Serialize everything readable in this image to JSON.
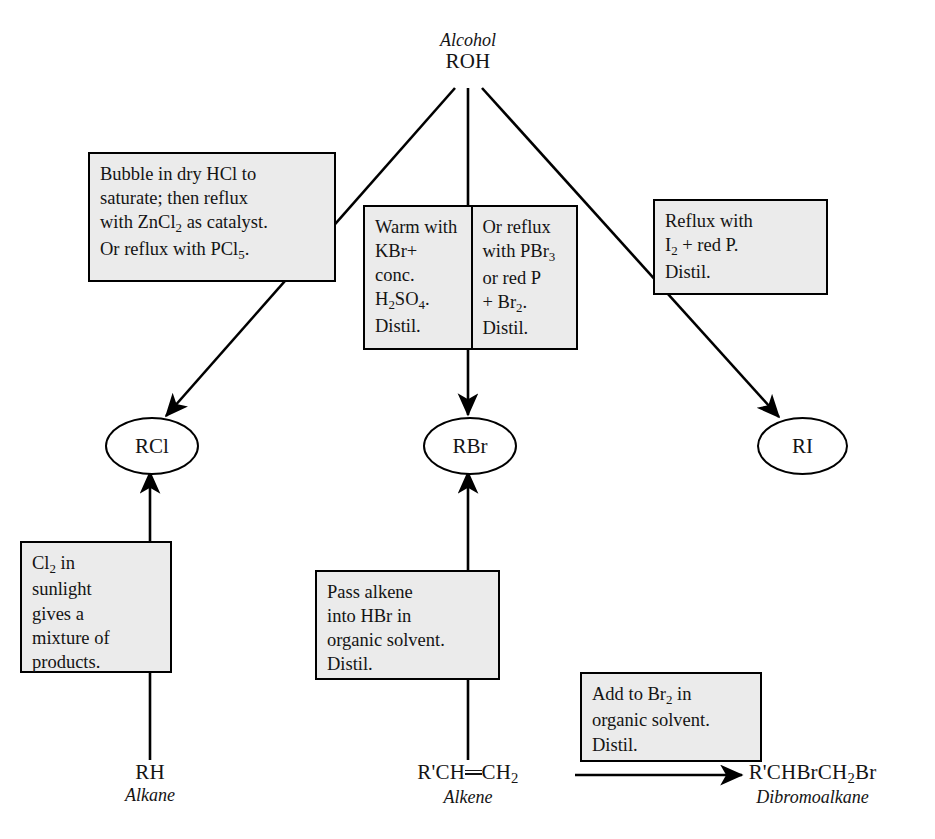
{
  "diagram": {
    "title_node": {
      "italic": "Alcohol",
      "formula": "ROH"
    },
    "products": [
      {
        "id": "rcl",
        "label": "RCl"
      },
      {
        "id": "rbr",
        "label": "RBr"
      },
      {
        "id": "ri",
        "label": "RI"
      }
    ],
    "reagent_boxes": {
      "to_rcl": {
        "lines": [
          "Bubble in dry HCl to",
          "saturate; then reflux",
          "with ZnCl|2| as catalyst.",
          "Or reflux with PCl|5|."
        ]
      },
      "to_rbr_left": {
        "lines": [
          "Warm with",
          "KBr+",
          "conc.",
          "H|2|SO|4|.",
          "Distil."
        ]
      },
      "to_rbr_right": {
        "lines": [
          "Or reflux",
          "with PBr|3|",
          "or red P",
          "+ Br|2|.",
          "Distil."
        ]
      },
      "to_ri": {
        "lines": [
          "Reflux with",
          "I|2| + red P.",
          "Distil."
        ]
      },
      "alkane_to_rcl": {
        "lines": [
          "Cl|2| in",
          "sunlight",
          "gives a",
          "mixture of",
          "products."
        ]
      },
      "alkene_to_rbr": {
        "lines": [
          "Pass alkene",
          "into HBr in",
          "organic solvent.",
          "Distil."
        ]
      },
      "alkene_to_dibromo": {
        "lines": [
          "Add to Br|2| in",
          "organic solvent.",
          "Distil."
        ]
      }
    },
    "bottom_labels": [
      {
        "id": "alkane",
        "formula": "RH",
        "name": "Alkane"
      },
      {
        "id": "alkene",
        "formula": "R'CH=CH|2|",
        "name": "Alkene"
      },
      {
        "id": "dibromoalkane",
        "formula": "R'CHBrCH|2|Br",
        "name": "Dibromoalkane"
      }
    ],
    "colors": {
      "box_fill": "#ebebeb",
      "stroke": "#000000",
      "text": "#141414",
      "page_background": "#ffffff"
    }
  },
  "chart_data": {
    "type": "diagram",
    "nodes": [
      {
        "id": "roh",
        "label": "ROH",
        "sublabel": "Alcohol",
        "shape": "text",
        "x": 468,
        "y": 60
      },
      {
        "id": "rcl",
        "label": "RCl",
        "sublabel": "",
        "shape": "ellipse",
        "x": 150,
        "y": 440
      },
      {
        "id": "rbr",
        "label": "RBr",
        "sublabel": "",
        "shape": "ellipse",
        "x": 468,
        "y": 440
      },
      {
        "id": "ri",
        "label": "RI",
        "sublabel": "",
        "shape": "ellipse",
        "x": 800,
        "y": 440
      },
      {
        "id": "rh",
        "label": "RH",
        "sublabel": "Alkane",
        "shape": "text",
        "x": 150,
        "y": 790
      },
      {
        "id": "alkene",
        "label": "R'CH=CH2",
        "sublabel": "Alkene",
        "shape": "text",
        "x": 468,
        "y": 790
      },
      {
        "id": "dibr",
        "label": "R'CHBrCH2Br",
        "sublabel": "Dibromoalkane",
        "shape": "text",
        "x": 810,
        "y": 790
      }
    ],
    "edges": [
      {
        "from": "roh",
        "to": "rcl",
        "reagent": "Bubble in dry HCl to saturate; then reflux with ZnCl2 as catalyst. Or reflux with PCl5."
      },
      {
        "from": "roh",
        "to": "rbr",
        "reagent": "Warm with KBr+ conc. H2SO4. Distil. / Or reflux with PBr3 or red P + Br2. Distil."
      },
      {
        "from": "roh",
        "to": "ri",
        "reagent": "Reflux with I2 + red P. Distil."
      },
      {
        "from": "rh",
        "to": "rcl",
        "reagent": "Cl2 in sunlight gives a mixture of products."
      },
      {
        "from": "alkene",
        "to": "rbr",
        "reagent": "Pass alkene into HBr in organic solvent. Distil."
      },
      {
        "from": "alkene",
        "to": "dibr",
        "reagent": "Add to Br2 in organic solvent. Distil."
      }
    ]
  }
}
